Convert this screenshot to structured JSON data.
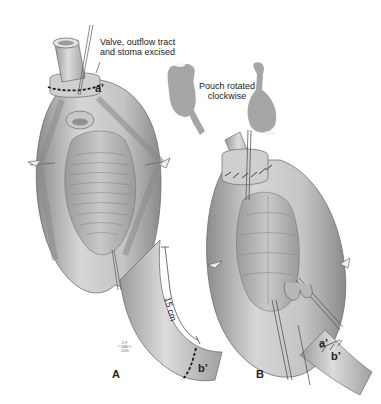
{
  "figure": {
    "panels": [
      {
        "id": "A",
        "letter": "A",
        "callout": {
          "line1": "Valve, outflow tract",
          "line2": "and stoma excised"
        },
        "markers": {
          "a_prime": "a’",
          "b_prime": "b’"
        },
        "measurement": "15 cm",
        "copyright": {
          "line1": "D.F.",
          "line2": "© MAYO",
          "line3": "2008"
        }
      },
      {
        "id": "B",
        "letter": "B",
        "markers": {
          "a_prime": "a’",
          "b_prime": "b’"
        }
      }
    ],
    "rotation_note": {
      "line1": "Pouch rotated",
      "line2": "clockwise"
    }
  },
  "colors": {
    "background": "#ffffff",
    "tissue_light": "#d9d9d9",
    "tissue_mid": "#b3b3b3",
    "tissue_dark": "#7a7a7a",
    "silhouette": "#a6a6a6",
    "ink": "#1a1a1a"
  }
}
